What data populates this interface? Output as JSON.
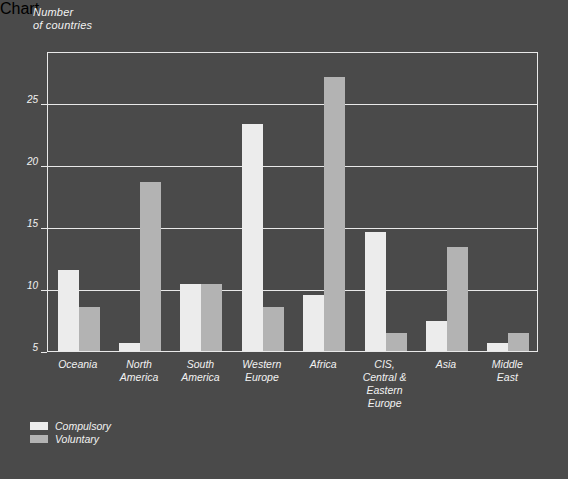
{
  "chart_data": {
    "type": "bar",
    "title": "",
    "ylabel": "Number\nof countries",
    "xlabel": "",
    "ylim": [
      5,
      29.2
    ],
    "yticks": [
      5,
      10,
      15,
      20,
      25
    ],
    "ytick_labels": [
      "5",
      "10",
      "15",
      "20",
      "25"
    ],
    "grid": "horizontal",
    "legend_position": "bottom-left",
    "categories": [
      "Oceania",
      "North\nAmerica",
      "South\nAmerica",
      "Western\nEurope",
      "Africa",
      "CIS,\nCentral &\nEastern Europe",
      "Asia",
      "Middle\nEast"
    ],
    "series": [
      {
        "name": "Compulsory",
        "color": "#ececec",
        "values": [
          11.6,
          5.7,
          10.5,
          23.4,
          9.6,
          14.7,
          7.5,
          5.7
        ]
      },
      {
        "name": "Voluntary",
        "color": "#b3b3b3",
        "values": [
          8.6,
          18.7,
          10.5,
          8.6,
          27.2,
          6.5,
          13.5,
          6.5
        ]
      }
    ]
  },
  "legend": {
    "items": [
      {
        "label": "Compulsory",
        "color": "#ececec"
      },
      {
        "label": "Voluntary",
        "color": "#b3b3b3"
      }
    ]
  },
  "colors": {
    "background": "#4a4a4a",
    "axis": "#e9e9e9",
    "text": "#f2f2f2",
    "compulsory": "#ececec",
    "voluntary": "#b3b3b3"
  }
}
